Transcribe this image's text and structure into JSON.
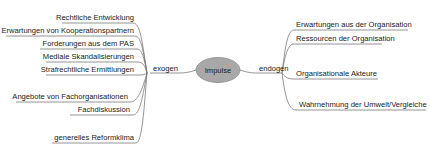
{
  "diagram": {
    "type": "mindmap",
    "root": {
      "label": "Impulse",
      "fill": "#a8a8a8"
    },
    "line_color": "#7a7a7a",
    "branches": {
      "left": {
        "label": "exogen",
        "items": [
          "Rechtliche Entwicklung",
          "Erwartungen von Kooperationspartnern",
          "Forderungen aus dem PAS",
          "Mediale Skandalisierungen",
          "Strafrechtliche Ermittlungen",
          "Angebote von Fachorganisationen",
          "Fachdiskussion",
          "generelles Reformklima"
        ]
      },
      "right": {
        "label": "endogen",
        "items": [
          "Erwartungen aus der Organisation",
          "Ressourcen der Organisation",
          "Organisationale Akteure",
          "Wahrnehmung der Umwelt/Vergleiche"
        ]
      }
    }
  }
}
